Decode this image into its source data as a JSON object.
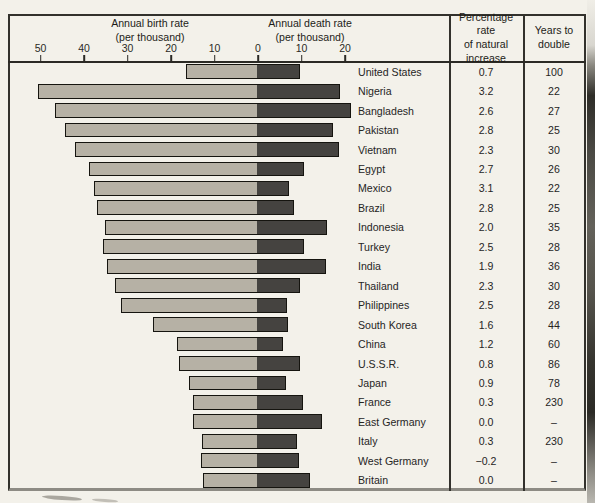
{
  "figure": {
    "kind": "scanned-book-figure",
    "columns": {
      "increase_header": "Percentage rate\nof natural\nincrease",
      "years_header": "Years to\ndouble"
    },
    "birth_axis_title": "Annual birth rate\n(per thousand)",
    "death_axis_title": "Annual death rate\n(per thousand)"
  },
  "chart_data": {
    "type": "bar",
    "orientation": "horizontal-diverging",
    "birth_axis": {
      "title": "Annual birth rate",
      "subtitle": "(per thousand)",
      "ticks": [
        50,
        40,
        30,
        20,
        10,
        0
      ],
      "range": [
        0,
        52
      ]
    },
    "death_axis": {
      "title": "Annual death rate",
      "subtitle": "(per thousand)",
      "ticks": [
        10,
        20
      ],
      "range": [
        0,
        22
      ]
    },
    "value_columns": [
      "Percentage rate of natural increase",
      "Years to double"
    ],
    "legend": "light bar = birth rate extending left of 0; dark bar = death rate extending right of 0",
    "rows": [
      {
        "country": "United States",
        "birth": 16.1,
        "death": 9.2,
        "increase": "0.7",
        "years": "100"
      },
      {
        "country": "Nigeria",
        "birth": 50.3,
        "death": 18.4,
        "increase": "3.2",
        "years": "22"
      },
      {
        "country": "Bangladesh",
        "birth": 46.3,
        "death": 21.0,
        "increase": "2.6",
        "years": "27"
      },
      {
        "country": "Pakistan",
        "birth": 43.9,
        "death": 16.9,
        "increase": "2.8",
        "years": "25"
      },
      {
        "country": "Vietnam",
        "birth": 41.8,
        "death": 18.2,
        "increase": "2.3",
        "years": "30"
      },
      {
        "country": "Egypt",
        "birth": 38.5,
        "death": 10.3,
        "increase": "2.7",
        "years": "26"
      },
      {
        "country": "Mexico",
        "birth": 37.4,
        "death": 6.7,
        "increase": "3.1",
        "years": "22"
      },
      {
        "country": "Brazil",
        "birth": 36.6,
        "death": 8.0,
        "increase": "2.8",
        "years": "25"
      },
      {
        "country": "Indonesia",
        "birth": 34.9,
        "death": 15.4,
        "increase": "2.0",
        "years": "35"
      },
      {
        "country": "Turkey",
        "birth": 35.2,
        "death": 10.3,
        "increase": "2.5",
        "years": "28"
      },
      {
        "country": "India",
        "birth": 34.4,
        "death": 15.2,
        "increase": "1.9",
        "years": "36"
      },
      {
        "country": "Thailand",
        "birth": 32.5,
        "death": 9.3,
        "increase": "2.3",
        "years": "30"
      },
      {
        "country": "Philippines",
        "birth": 31.1,
        "death": 6.2,
        "increase": "2.5",
        "years": "28"
      },
      {
        "country": "South Korea",
        "birth": 23.7,
        "death": 6.6,
        "increase": "1.6",
        "years": "44"
      },
      {
        "country": "China",
        "birth": 18.3,
        "death": 5.4,
        "increase": "1.2",
        "years": "60"
      },
      {
        "country": "U.S.S.R.",
        "birth": 17.9,
        "death": 9.3,
        "increase": "0.8",
        "years": "86"
      },
      {
        "country": "Japan",
        "birth": 15.6,
        "death": 6.0,
        "increase": "0.9",
        "years": "78"
      },
      {
        "country": "France",
        "birth": 14.5,
        "death": 10.0,
        "increase": "0.3",
        "years": "230"
      },
      {
        "country": "East Germany",
        "birth": 14.5,
        "death": 14.3,
        "increase": "0.0",
        "years": "–"
      },
      {
        "country": "Italy",
        "birth": 12.6,
        "death": 8.7,
        "increase": "0.3",
        "years": "230"
      },
      {
        "country": "West Germany",
        "birth": 12.7,
        "death": 9.0,
        "increase": "−0.2",
        "years": "–"
      },
      {
        "country": "Britain",
        "birth": 12.2,
        "death": 11.6,
        "increase": "0.0",
        "years": "–"
      }
    ],
    "layout_hints": {
      "zero_x": 258,
      "px_per_unit": 4.35,
      "chart_top": 62,
      "chart_bottom": 490,
      "row_pitch": 19.4545,
      "bar_height": 14.8,
      "tick_label_y": 42,
      "grid": "off",
      "legend_position": "none"
    },
    "colors": {
      "bar_birth": "#b6b1a5",
      "bar_death": "#454340",
      "bar_border": "#15140f",
      "frame_line": "#32312c",
      "page_bg": "#f3f1ea"
    }
  }
}
